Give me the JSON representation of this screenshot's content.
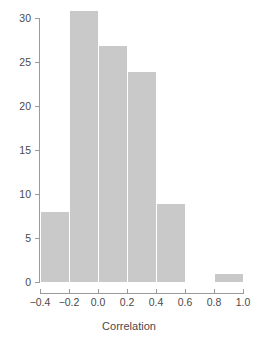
{
  "chart_data": {
    "type": "bar",
    "title": "",
    "subtitle": "",
    "xlabel": "Correlation",
    "ylabel": "",
    "bin_width": 0.2,
    "bin_edges": [
      -0.4,
      -0.2,
      0.0,
      0.2,
      0.4,
      0.6,
      0.8,
      1.0
    ],
    "categories": [
      "-0.4 to -0.2",
      "-0.2 to 0.0",
      "0.0 to 0.2",
      "0.2 to 0.4",
      "0.4 to 0.6",
      "0.6 to 0.8",
      "0.8 to 1.0"
    ],
    "values": [
      8,
      31,
      27,
      24,
      9,
      0,
      1
    ],
    "xlim": [
      -0.4,
      1.0
    ],
    "ylim": [
      0,
      31
    ],
    "x_ticks": [
      -0.4,
      -0.2,
      0.0,
      0.2,
      0.4,
      0.6,
      0.8,
      1.0
    ],
    "x_tick_labels": [
      "−0.4",
      "−0.2",
      "0.0",
      "0.2",
      "0.4",
      "0.6",
      "0.8",
      "1.0"
    ],
    "y_ticks": [
      0,
      5,
      10,
      15,
      20,
      25,
      30
    ],
    "y_tick_labels": [
      "0",
      "5",
      "10",
      "15",
      "20",
      "25",
      "30"
    ],
    "grid": false,
    "legend": null,
    "bar_color": "#c9c9c9",
    "bar_edge_color": "#ffffff",
    "axis_color": "#9a9a9a",
    "text_color": "#4a4a4a",
    "background": "#ffffff"
  },
  "axes": {
    "x_title": "Correlation",
    "y_title": ""
  }
}
